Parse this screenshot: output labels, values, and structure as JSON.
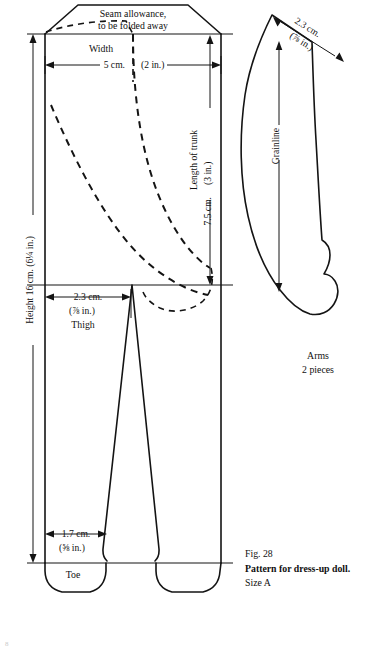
{
  "figure": {
    "number": "Fig.  28",
    "caption": "Pattern for dress-up doll.",
    "size": "Size A",
    "page_number": "8"
  },
  "body_piece": {
    "seam_allowance_line1": "Seam allowance,",
    "seam_allowance_line2": "to be folded away",
    "width_label": "Width",
    "width_cm": "5 cm.",
    "width_in": "(2 in.)",
    "trunk_label": "Length of trunk",
    "trunk_cm": "7.5 cm.",
    "trunk_in": "(3 in.)",
    "height_label": "Height 16 cm. (6¼ in.)",
    "thigh_cm": "2.3 cm.",
    "thigh_in": "(⅞ in.)",
    "thigh_label": "Thigh",
    "toe_cm": "1.7 cm.",
    "toe_in": "(⅝ in.)",
    "toe_label": "Toe"
  },
  "arm_piece": {
    "width_cm": "2.3 cm.",
    "width_in": "(⅞ in.)",
    "grainline_label": "Grainline",
    "name": "Arms",
    "pieces": "2 pieces"
  },
  "colors": {
    "ink": "#141414",
    "paper": "#ffffff"
  }
}
